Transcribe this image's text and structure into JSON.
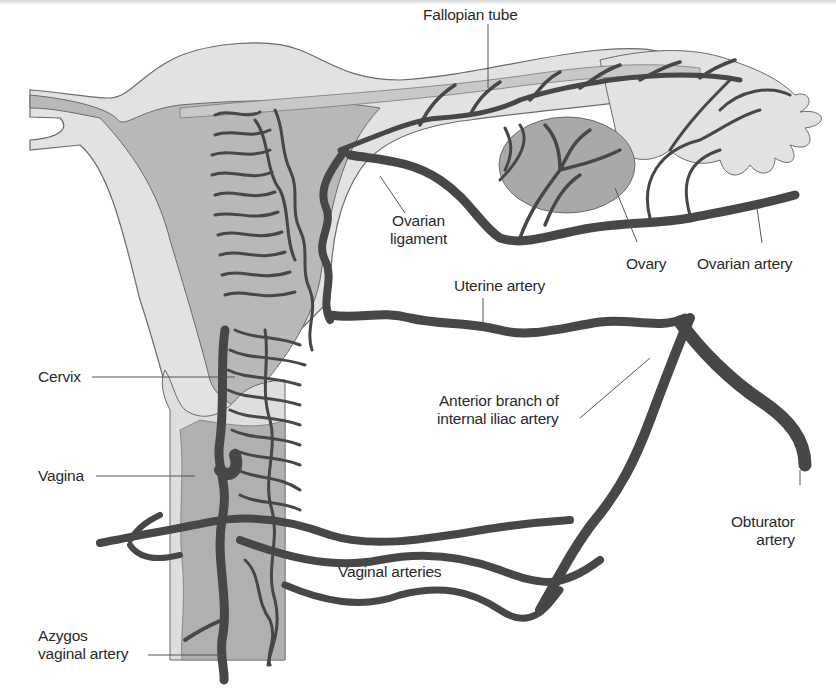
{
  "figure": {
    "colors": {
      "background": "#ffffff",
      "tissue_light": "#e2e2e2",
      "tissue_mid": "#b8b8b8",
      "ovary": "#a9a9a9",
      "artery": "#474747",
      "outline": "#6a6a6a",
      "label_text": "#2a2a2a",
      "leader_line": "#555555"
    }
  },
  "labels": {
    "fallopian_tube": "Fallopian tube",
    "ovarian_ligament_line1": "Ovarian",
    "ovarian_ligament_line2": "ligament",
    "ovary": "Ovary",
    "ovarian_artery": "Ovarian artery",
    "uterine_artery": "Uterine artery",
    "cervix": "Cervix",
    "anterior_branch_line1": "Anterior branch of",
    "anterior_branch_line2": "internal iliac artery",
    "vagina": "Vagina",
    "obturator_line1": "Obturator",
    "obturator_line2": "artery",
    "vaginal_arteries": "Vaginal arteries",
    "azygos_line1": "Azygos",
    "azygos_line2": "vaginal artery"
  }
}
